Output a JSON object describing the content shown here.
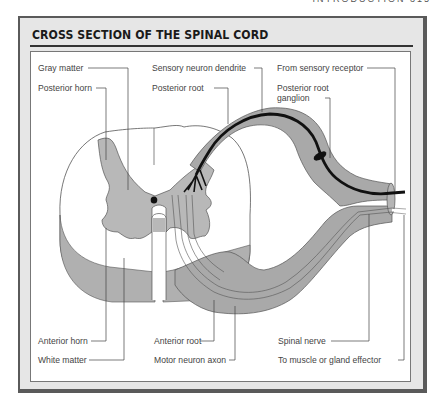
{
  "page_header": "INTRODUCTION  315",
  "figure": {
    "title": "CROSS SECTION OF THE SPINAL CORD",
    "labels": {
      "gray_matter": "Gray matter",
      "posterior_horn": "Posterior horn",
      "sensory_neuron_dendrite": "Sensory neuron dendrite",
      "posterior_root": "Posterior root",
      "from_sensory_receptor": "From sensory receptor",
      "posterior_root_ganglion_1": "Posterior root",
      "posterior_root_ganglion_2": "ganglion",
      "anterior_horn": "Anterior horn",
      "white_matter": "White matter",
      "anterior_root": "Anterior root",
      "motor_neuron_axon": "Motor neuron axon",
      "spinal_nerve": "Spinal nerve",
      "to_muscle_or_gland_effector": "To muscle or gland effector"
    },
    "colors": {
      "gray_fill": "#b5b5b5",
      "nerve_fill": "#a9a9a9",
      "frame_bg": "#e6e6e6",
      "frame_border": "#5a5a5a",
      "neuron_black": "#111111"
    }
  }
}
